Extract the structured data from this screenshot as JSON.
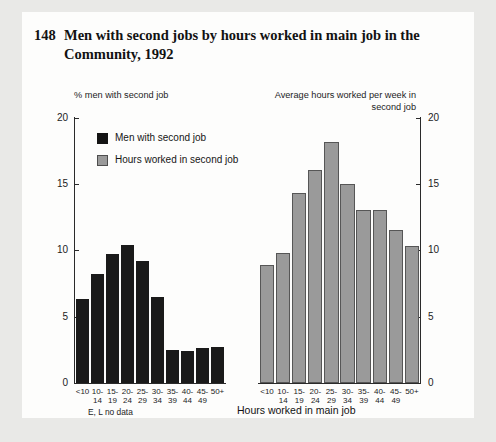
{
  "figure": {
    "number": "148",
    "title": "Men with second jobs by hours worked in main job in the Community, 1992"
  },
  "left_axis_caption": "% men with second job",
  "right_axis_caption": "Average hours worked per week in second job",
  "x_axis_title": "Hours worked in main job",
  "footnote": "E, L no data",
  "legend": [
    {
      "label": "Men with second job",
      "color": "#141414"
    },
    {
      "label": "Hours worked in second job",
      "color": "#9a9a9a"
    }
  ],
  "chart_data": {
    "type": "bar",
    "title": "Men with second jobs by hours worked in main job in the Community, 1992",
    "xlabel": "Hours worked in main job",
    "categories": [
      "<10",
      "10-14",
      "15-19",
      "20-24",
      "25-29",
      "30-34",
      "35-39",
      "40-44",
      "45-49",
      "50+"
    ],
    "panels": [
      {
        "name": "Men with second job",
        "ylabel": "% men with second job",
        "ylim": [
          0,
          20
        ],
        "yticks": [
          "0",
          "5",
          "10",
          "15",
          "20"
        ],
        "color": "#1a1a1a",
        "values": [
          6.3,
          8.2,
          9.7,
          10.4,
          9.2,
          6.5,
          2.5,
          2.4,
          2.6,
          2.7
        ]
      },
      {
        "name": "Hours worked in second job",
        "ylabel": "Average hours worked per week in second job",
        "ylim": [
          0,
          20
        ],
        "yticks": [
          "0",
          "5",
          "10",
          "15",
          "20"
        ],
        "color": "#9a9a9a",
        "values": [
          8.9,
          9.8,
          14.3,
          16.0,
          18.1,
          15.0,
          13.0,
          13.0,
          11.5,
          10.3
        ]
      }
    ],
    "grid": false,
    "legend_position": "upper-left",
    "notes": "E, L no data"
  }
}
